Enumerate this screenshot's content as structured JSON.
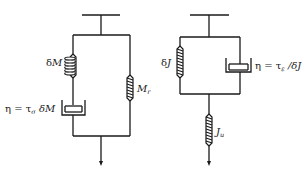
{
  "diagram": {
    "left_model": {
      "name": "series spring-dashpot in parallel with spring",
      "spring_top_left": {
        "label_main": "δ",
        "label_var": "M"
      },
      "dashpot": {
        "label_eta": "η = τ",
        "label_sub": "σ",
        "label_tail": " δM"
      },
      "spring_right": {
        "label_var": "M",
        "label_sub": "r"
      }
    },
    "right_model": {
      "name": "parallel spring-dashpot in series with spring",
      "spring_left": {
        "label_main": "δ",
        "label_var": "J"
      },
      "dashpot": {
        "label_eta": "η = τ",
        "label_sub": "ε",
        "label_tail": " /δJ"
      },
      "spring_bottom": {
        "label_var": "J",
        "label_sub": "u"
      }
    },
    "colors": {
      "line": "#1a1a1a",
      "background": "#ffffff"
    }
  }
}
